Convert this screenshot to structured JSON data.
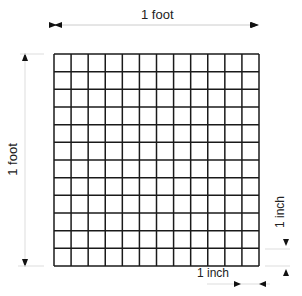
{
  "diagram": {
    "grid": {
      "rows": 12,
      "cols": 12,
      "line_color": "#1a1a1a"
    },
    "labels": {
      "top": "1 foot",
      "left": "1 foot",
      "right_small": "1 inch",
      "bottom_small": "1 inch"
    }
  }
}
